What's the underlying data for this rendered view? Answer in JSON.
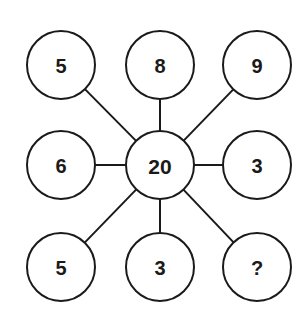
{
  "puzzle": {
    "center": {
      "label": "20",
      "cx": 160,
      "cy": 165
    },
    "radius": 34,
    "outer": [
      {
        "label": "5",
        "cx": 61,
        "cy": 65
      },
      {
        "label": "8",
        "cx": 160,
        "cy": 65
      },
      {
        "label": "9",
        "cx": 257,
        "cy": 65
      },
      {
        "label": "6",
        "cx": 61,
        "cy": 165
      },
      {
        "label": "3",
        "cx": 257,
        "cy": 165
      },
      {
        "label": "5",
        "cx": 61,
        "cy": 267
      },
      {
        "label": "3",
        "cx": 160,
        "cy": 267
      },
      {
        "label": "?",
        "cx": 257,
        "cy": 267
      }
    ]
  },
  "colors": {
    "stroke": "#1a1a1a",
    "fill": "#ffffff"
  }
}
